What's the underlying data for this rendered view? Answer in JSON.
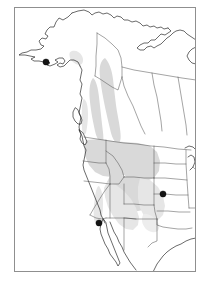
{
  "figure": {
    "kind": "distribution-range-map",
    "region": "Western North America",
    "background_color": "#ffffff",
    "frame": {
      "x": 14,
      "y": 7,
      "width": 182,
      "height": 265,
      "stroke_color": "#8f8f8f",
      "fill_color": "#ffffff"
    }
  },
  "legend_colors": {
    "range_fill": "#d9d9d9",
    "range_fill_light": "#e6e6e6",
    "coastline_stroke": "#1a1a1a",
    "political_boundary_stroke": "#4a4a4a",
    "locality_dot_fill": "#141414"
  },
  "map": {
    "coastlines": [
      {
        "name": "alaska-mainland-and-peninsula",
        "path": "M 72 13 L 68 17 L 63 20 L 59 18 L 56 22 L 54 27 L 50 27 L 47 30 L 45 34 L 48 36 L 46 39 L 42 38 L 39 41 L 41 45 L 44 46 L 41 49 L 36 50 L 31 50 L 27 52 L 22 53 L 19 55 L 25 55 L 30 56 L 35 57 L 31 59 L 34 61 L 39 61 L 44 62 L 48 61 L 50 63 L 47 65 L 50 66 L 55 64 L 58 62 L 55 60 L 59 58 L 63 58 L 65 61 L 63 64 L 60 63 L 57 65 L 60 67 L 64 66 L 67 63 L 70 60 L 74 60 L 78 62 L 80 66"
      },
      {
        "name": "alaska-north-and-yukon-coast",
        "path": "M 72 13 L 78 11 L 84 10 L 89 12 L 92 15 L 95 13 L 99 12 L 103 14 L 107 13 L 111 15 L 114 18 L 117 16 L 121 17 L 124 20 L 128 20 L 132 22 L 136 21 L 140 23 L 143 26 L 147 25 L 150 27 L 154 26 L 157 28 L 161 27 L 164 29 L 168 28"
      },
      {
        "name": "arctic-canada-coast",
        "path": "M 168 28 L 171 31 L 168 33 L 165 35 L 161 34 L 158 37 L 155 40 L 151 40 L 148 43 L 144 43 L 140 45 L 137 48 L 140 50 L 144 50 L 147 47 L 151 46 L 154 48 L 157 46 L 161 44 L 164 41 L 167 38 L 170 36 L 173 33 L 176 31 L 180 30 L 184 31 L 187 34 L 190 36 L 193 38 L 196 40"
      },
      {
        "name": "hudson-bay-west-shore",
        "path": "M 196 64 L 192 63 L 189 60 L 187 56 L 189 52 L 192 49 L 196 47"
      },
      {
        "name": "pacific-coast-british-columbia-to-california",
        "path": "M 80 66 L 82 70 L 81 75 L 80 80 L 82 84 L 81 89 L 80 94 L 82 98 L 81 103 L 80 108 L 79 113 L 81 117 L 80 122 L 79 127 L 80 132 L 82 136 L 83 141 L 84 146 L 86 150 L 85 155 L 84 160 L 83 165 L 84 170 L 86 175 L 88 180 L 90 185 L 92 190 L 94 195 L 96 200 L 98 205 L 100 210 L 101 215 L 103 219 L 105 223"
      },
      {
        "name": "vancouver-island",
        "path": "M 75 108 L 73 112 L 73 117 L 75 121 L 78 124 L 81 124 L 82 120 L 80 115 L 78 110 Z"
      },
      {
        "name": "puget-sound-inlet",
        "path": "M 79 130 L 81 134 L 80 139 L 82 143 L 85 145 L 87 142 L 85 137 L 83 133 Z"
      },
      {
        "name": "baja-california-peninsula",
        "path": "M 103 219 L 101 224 L 100 229 L 101 234 L 103 239 L 105 244 L 108 249 L 110 254 L 113 258 L 116 262 L 118 266 L 120 263 L 118 258 L 116 253 L 114 248 L 112 243 L 110 238 L 108 233 L 107 228 L 106 223 Z"
      },
      {
        "name": "mexico-west-mainland-and-gulf-of-california",
        "path": "M 110 222 L 112 227 L 114 232 L 117 237 L 119 242 L 122 247 L 124 252 L 127 257 L 130 262 L 133 266 L 136 270"
      },
      {
        "name": "gulf-of-mexico-and-texas-coast",
        "path": "M 196 238 L 191 239 L 186 241 L 181 244 L 176 246 L 171 249 L 167 252 L 163 256 L 160 260 L 157 264 L 155 268 L 153 272"
      },
      {
        "name": "great-lakes-superior-michigan",
        "path": "M 185 148 L 189 146 L 193 147 L 196 150 M 188 157 L 191 155 L 194 157 L 195 162 L 193 167 L 190 170"
      }
    ],
    "political_boundaries": [
      {
        "name": "alaska-yukon-border",
        "path": "M 97 33 L 97 44 L 96 56 L 96 66 L 95 76"
      },
      {
        "name": "yukon-nwt-border",
        "path": "M 97 33 L 105 38 L 112 44 L 118 50 L 121 58 L 122 67 L 122 77"
      },
      {
        "name": "bc-alberta-border",
        "path": "M 122 77 L 124 86 L 128 96 L 133 106 L 137 116 L 141 126 L 145 134"
      },
      {
        "name": "bc-us-border-west",
        "path": "M 95 76 L 100 79 L 106 83 L 112 87 L 118 90 L 122 77"
      },
      {
        "name": "nwt-provinces-60th-parallel",
        "path": "M 122 67 L 134 70 L 146 72 L 158 74 L 170 76 L 182 78 L 196 80"
      },
      {
        "name": "alberta-saskatchewan-border",
        "path": "M 152 73 L 154 85 L 157 97 L 159 109 L 161 121 L 162 131"
      },
      {
        "name": "saskatchewan-manitoba-border",
        "path": "M 178 77 L 180 89 L 182 101 L 184 113 L 186 125 L 187 135"
      },
      {
        "name": "canada-usa-49th-parallel",
        "path": "M 84 137 L 97 139 L 110 141 L 124 143 L 137 144 L 151 146 L 164 147 L 178 149 L 191 150"
      },
      {
        "name": "washington-oregon-border",
        "path": "M 83 161 L 91 162 L 99 163 L 106 163"
      },
      {
        "name": "washington-idaho-border",
        "path": "M 106 140 L 106 151 L 106 163"
      },
      {
        "name": "oregon-california-nevada-border",
        "path": "M 84 181 L 93 182 L 102 183 L 110 184"
      },
      {
        "name": "oregon-idaho-border",
        "path": "M 106 163 L 109 169 L 110 176 L 110 184"
      },
      {
        "name": "idaho-montana-border",
        "path": "M 106 151 L 113 156 L 118 163 L 122 170 L 124 177"
      },
      {
        "name": "montana-wyoming-border",
        "path": "M 124 177 L 134 177 L 144 178 L 154 178"
      },
      {
        "name": "montana-north-dakota-border",
        "path": "M 154 146 L 154 160 L 154 178"
      },
      {
        "name": "idaho-wyoming-utah-nevada",
        "path": "M 110 184 L 119 184 L 124 177"
      },
      {
        "name": "wyoming-colorado-border",
        "path": "M 124 204 L 134 204 L 144 205 L 154 205"
      },
      {
        "name": "wyoming-nebraska-south-dakota",
        "path": "M 154 178 L 154 191 L 154 205"
      },
      {
        "name": "utah-nevada-border",
        "path": "M 110 184 L 110 196 L 110 208 L 110 218"
      },
      {
        "name": "utah-colorado-border",
        "path": "M 124 184 L 124 194 L 124 204"
      },
      {
        "name": "utah-arizona-new-mexico-border",
        "path": "M 106 218 L 116 218 L 126 218 L 136 219"
      },
      {
        "name": "arizona-new-mexico-border",
        "path": "M 124 218 L 124 229 L 124 240 L 124 250"
      },
      {
        "name": "colorado-new-mexico-border",
        "path": "M 124 218 L 136 219 L 148 219 L 157 219"
      },
      {
        "name": "colorado-kansas-nebraska",
        "path": "M 154 205 L 155 212 L 157 219"
      },
      {
        "name": "nevada-california-border",
        "path": "M 110 184 L 104 192 L 99 200 L 94 208 L 90 215"
      },
      {
        "name": "california-arizona-border",
        "path": "M 90 215 L 96 218 L 102 219 L 106 218"
      },
      {
        "name": "north-dakota-south-dakota",
        "path": "M 154 163 L 165 163 L 176 164 L 186 164"
      },
      {
        "name": "south-dakota-nebraska",
        "path": "M 154 178 L 165 178 L 176 179 L 187 180"
      },
      {
        "name": "nebraska-kansas",
        "path": "M 154 194 L 165 194 L 176 195 L 188 195"
      },
      {
        "name": "kansas-oklahoma",
        "path": "M 157 211 L 168 211 L 179 212 L 190 212"
      },
      {
        "name": "dakotas-minnesota-iowa-east",
        "path": "M 186 150 L 186 164 L 187 180 L 188 195 L 189 208"
      },
      {
        "name": "oklahoma-texas",
        "path": "M 157 219 L 157 225 L 163 227 L 170 228 L 178 229 L 186 229 L 192 228"
      },
      {
        "name": "new-mexico-texas",
        "path": "M 157 219 L 157 231 L 157 241 L 152 243 L 148 247"
      },
      {
        "name": "minnesota-iowa-wisconsin",
        "path": "M 189 208 L 196 208 M 193 167 L 196 170"
      }
    ],
    "range_polygons": [
      {
        "name": "range-core-northern-bc",
        "fill": "#d9d9d9",
        "path": "M 105 58 C 109 62 112 70 113 79 C 114 88 115 97 116 105 C 117 113 119 121 120 129 C 121 136 121 141 119 143 C 116 144 113 140 111 133 C 109 125 107 116 105 107 C 103 97 101 87 100 77 C 99 68 100 61 105 58 Z"
      },
      {
        "name": "range-core-bc-interior",
        "fill": "#d9d9d9",
        "path": "M 93 78 C 96 80 98 88 99 97 C 100 106 101 115 102 124 C 103 132 104 138 103 142 C 100 144 97 139 95 131 C 93 122 91 112 90 102 C 89 92 89 83 93 78 Z"
      },
      {
        "name": "range-usa-pacific-northwest",
        "fill": "#d9d9d9",
        "path": "M 86 140 L 100 139 L 113 141 L 124 142 L 131 146 L 134 154 L 134 164 L 130 172 L 122 176 L 112 177 L 103 176 L 95 172 L 89 165 L 85 156 L 84 147 Z"
      },
      {
        "name": "range-usa-northern-rockies",
        "fill": "#d9d9d9",
        "path": "M 124 142 L 138 143 L 150 146 L 157 152 L 160 161 L 159 171 L 154 178 L 146 181 L 136 181 L 128 179 L 123 173 L 122 163 L 122 152 Z"
      },
      {
        "name": "range-usa-central-rockies",
        "fill": "#d9d9d9",
        "path": "M 110 176 L 122 176 L 134 178 L 144 181 L 151 188 L 153 197 L 150 205 L 143 210 L 133 212 L 123 211 L 114 207 L 108 200 L 106 191 L 107 182 Z"
      },
      {
        "name": "range-usa-great-basin-southwest",
        "fill": "#e6e6e6",
        "path": "M 107 182 L 116 185 L 124 191 L 131 199 L 136 208 L 139 217 L 138 225 L 133 230 L 126 229 L 119 224 L 113 216 L 108 207 L 105 197 L 104 188 Z"
      },
      {
        "name": "range-usa-southern-plains-lobe",
        "fill": "#e6e6e6",
        "path": "M 140 178 L 150 180 L 158 187 L 163 196 L 165 206 L 163 215 L 157 221 L 150 221 L 144 216 L 140 208 L 138 198 L 138 187 Z"
      },
      {
        "name": "range-sierra-nevada-california",
        "fill": "#e6e6e6",
        "path": "M 99 186 C 102 190 103 197 103 204 C 103 211 102 218 100 223 C 98 226 95 224 94 219 C 93 212 94 204 95 197 C 96 190 97 186 99 186 Z"
      },
      {
        "name": "range-faint-alaska-patch",
        "fill": "#e6e6e6",
        "path": "M 72 51 C 76 50 80 52 82 56 C 84 60 83 64 80 65 C 76 65 72 62 70 58 C 69 54 69 52 72 51 Z"
      },
      {
        "name": "range-faint-southern-bc-coast",
        "fill": "#e6e6e6",
        "path": "M 84 99 C 87 101 88 107 88 114 C 88 121 87 128 86 133 C 84 136 82 133 82 127 C 81 120 82 112 82 106 C 83 101 83 99 84 99 Z"
      },
      {
        "name": "range-faint-texas-panhandle",
        "fill": "#ededed",
        "path": "M 146 214 C 152 215 157 219 159 225 C 160 230 157 233 152 232 C 147 231 143 227 142 221 C 142 216 143 213 146 214 Z"
      }
    ],
    "locality_records": [
      {
        "name": "locality-alaska-peninsula",
        "x": 46,
        "y": 62,
        "r": 3.1,
        "fill": "#141414"
      },
      {
        "name": "locality-southern-california",
        "x": 99,
        "y": 223,
        "r": 3.1,
        "fill": "#141414"
      },
      {
        "name": "locality-central-plains-kansas",
        "x": 163,
        "y": 194,
        "r": 3.1,
        "fill": "#141414"
      }
    ]
  }
}
